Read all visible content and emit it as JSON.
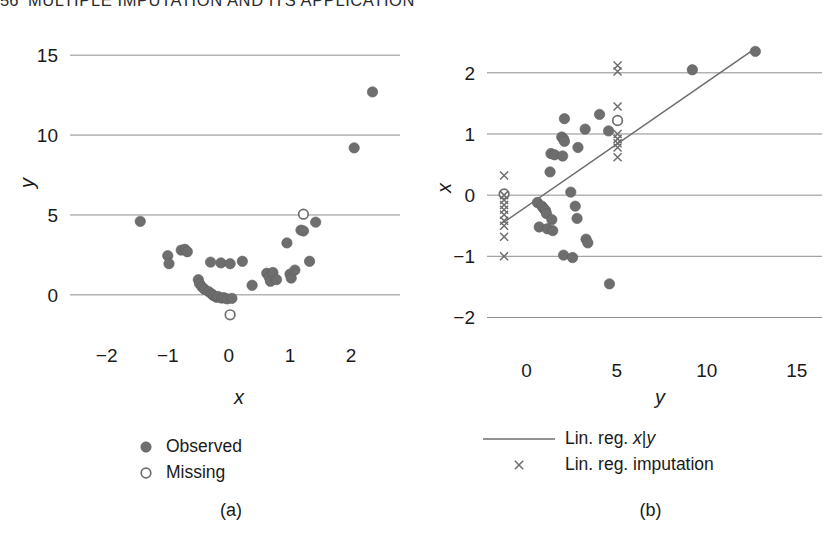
{
  "running_head": {
    "folio": "56",
    "title": "MULTIPLE IMPUTATION AND ITS APPLICATION"
  },
  "colors": {
    "marker": "#6e6e6e",
    "marker_edge": "#5e5e5e",
    "gridline": "#8d8d8d",
    "line": "#6e6e6e",
    "text": "#1a1a1a"
  },
  "chart_data": [
    {
      "type": "scatter",
      "panel": "a",
      "caption": "(a)",
      "title": "",
      "xlabel": "x",
      "ylabel": "y",
      "xlim": [
        -2.6,
        2.8
      ],
      "ylim": [
        -2.2,
        16.2
      ],
      "xticks": [
        -2,
        -1,
        0,
        1,
        2
      ],
      "xticklabels": [
        "−2",
        "−1",
        "0",
        "1",
        "2"
      ],
      "yticks": [
        0,
        5,
        10,
        15
      ],
      "yticklabels": [
        "0",
        "5",
        "10",
        "15"
      ],
      "grid": "horizontal",
      "legend_position": "below",
      "legend": [
        {
          "label": "Observed",
          "marker": "filled-circle"
        },
        {
          "label": "Missing",
          "marker": "open-circle"
        }
      ],
      "series": [
        {
          "name": "Observed",
          "marker": "filled-circle",
          "points": [
            [
              -1.45,
              4.6
            ],
            [
              -1.0,
              2.45
            ],
            [
              -0.98,
              1.95
            ],
            [
              -0.78,
              2.8
            ],
            [
              -0.72,
              2.85
            ],
            [
              -0.68,
              2.7
            ],
            [
              -0.5,
              0.95
            ],
            [
              -0.48,
              0.7
            ],
            [
              -0.44,
              0.5
            ],
            [
              -0.4,
              0.35
            ],
            [
              -0.33,
              0.2
            ],
            [
              -0.3,
              2.05
            ],
            [
              -0.28,
              0.05
            ],
            [
              -0.25,
              -0.05
            ],
            [
              -0.2,
              -0.15
            ],
            [
              -0.18,
              -0.1
            ],
            [
              -0.13,
              2.0
            ],
            [
              -0.12,
              -0.2
            ],
            [
              -0.08,
              -0.18
            ],
            [
              -0.03,
              -0.25
            ],
            [
              0.02,
              1.95
            ],
            [
              0.05,
              -0.22
            ],
            [
              0.22,
              2.1
            ],
            [
              0.38,
              0.6
            ],
            [
              0.62,
              1.35
            ],
            [
              0.66,
              1.1
            ],
            [
              0.68,
              0.85
            ],
            [
              0.72,
              1.4
            ],
            [
              0.78,
              0.95
            ],
            [
              0.95,
              3.25
            ],
            [
              1.0,
              1.3
            ],
            [
              1.02,
              1.05
            ],
            [
              1.08,
              1.55
            ],
            [
              1.18,
              4.05
            ],
            [
              1.22,
              4.0
            ],
            [
              1.32,
              2.1
            ],
            [
              1.42,
              4.55
            ],
            [
              2.05,
              9.2
            ],
            [
              2.35,
              12.7
            ]
          ]
        },
        {
          "name": "Missing",
          "marker": "open-circle",
          "points": [
            [
              1.22,
              5.05
            ],
            [
              0.02,
              -1.25
            ]
          ]
        }
      ]
    },
    {
      "type": "scatter",
      "panel": "b",
      "caption": "(b)",
      "title": "",
      "xlabel": "y",
      "ylabel": "x",
      "xlim": [
        -2.2,
        16.4
      ],
      "ylim": [
        -2.45,
        2.7
      ],
      "xticks": [
        0,
        5,
        10,
        15
      ],
      "xticklabels": [
        "0",
        "5",
        "10",
        "15"
      ],
      "yticks": [
        -2,
        -1,
        0,
        1,
        2
      ],
      "yticklabels": [
        "−2",
        "−1",
        "0",
        "1",
        "2"
      ],
      "grid": "horizontal",
      "legend_position": "below",
      "legend": [
        {
          "label_parts": [
            "Lin. reg. ",
            "x",
            "|",
            "y"
          ],
          "marker": "line"
        },
        {
          "label_parts": [
            "Lin. reg. imputation"
          ],
          "marker": "cross"
        }
      ],
      "series": [
        {
          "name": "Observed",
          "marker": "filled-circle",
          "points": [
            [
              12.7,
              2.35
            ],
            [
              9.2,
              2.05
            ],
            [
              4.05,
              1.32
            ],
            [
              2.1,
              1.25
            ],
            [
              3.25,
              1.08
            ],
            [
              4.55,
              1.05
            ],
            [
              1.95,
              0.95
            ],
            [
              2.05,
              0.92
            ],
            [
              2.1,
              0.88
            ],
            [
              2.85,
              0.78
            ],
            [
              1.35,
              0.68
            ],
            [
              1.55,
              0.66
            ],
            [
              2.0,
              0.64
            ],
            [
              1.3,
              0.38
            ],
            [
              2.45,
              0.05
            ],
            [
              0.6,
              -0.12
            ],
            [
              0.85,
              -0.18
            ],
            [
              2.7,
              -0.18
            ],
            [
              0.95,
              -0.22
            ],
            [
              1.05,
              -0.25
            ],
            [
              1.1,
              -0.3
            ],
            [
              1.4,
              -0.4
            ],
            [
              2.8,
              -0.38
            ],
            [
              0.7,
              -0.52
            ],
            [
              1.15,
              -0.55
            ],
            [
              1.45,
              -0.58
            ],
            [
              3.3,
              -0.72
            ],
            [
              3.4,
              -0.78
            ],
            [
              2.05,
              -0.98
            ],
            [
              2.55,
              -1.02
            ],
            [
              4.6,
              -1.45
            ]
          ]
        },
        {
          "name": "Missing",
          "marker": "open-circle",
          "points": [
            [
              5.05,
              1.22
            ],
            [
              -1.25,
              0.02
            ]
          ]
        },
        {
          "name": "Lin. reg. imputation",
          "marker": "cross",
          "points": [
            [
              5.05,
              2.12
            ],
            [
              5.05,
              2.02
            ],
            [
              5.05,
              1.45
            ],
            [
              5.05,
              1.0
            ],
            [
              5.05,
              0.92
            ],
            [
              5.05,
              0.85
            ],
            [
              5.05,
              0.78
            ],
            [
              5.05,
              0.62
            ],
            [
              -1.25,
              0.32
            ],
            [
              -1.25,
              0.0
            ],
            [
              -1.25,
              -0.08
            ],
            [
              -1.25,
              -0.16
            ],
            [
              -1.25,
              -0.24
            ],
            [
              -1.25,
              -0.32
            ],
            [
              -1.25,
              -0.42
            ],
            [
              -1.25,
              -0.5
            ],
            [
              -1.25,
              -0.68
            ],
            [
              -1.25,
              -1.0
            ]
          ]
        },
        {
          "name": "Lin. reg. x|y",
          "marker": "line",
          "line": [
            [
              -1.3,
              -0.45
            ],
            [
              12.7,
              2.4
            ]
          ]
        }
      ]
    }
  ]
}
